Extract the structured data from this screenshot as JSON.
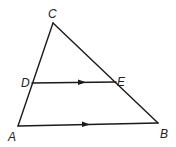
{
  "diagram": {
    "type": "triangle-with-parallel-segment",
    "points": {
      "A": {
        "x": 18,
        "y": 126
      },
      "B": {
        "x": 158,
        "y": 123
      },
      "C": {
        "x": 53,
        "y": 23
      },
      "D": {
        "x": 32,
        "y": 83
      },
      "E": {
        "x": 116,
        "y": 82
      }
    },
    "labels": {
      "A": "A",
      "B": "B",
      "C": "C",
      "D": "D",
      "E": "E"
    },
    "segments": [
      {
        "from": "A",
        "to": "C"
      },
      {
        "from": "C",
        "to": "B"
      },
      {
        "from": "A",
        "to": "B",
        "parallel_mark": true
      },
      {
        "from": "D",
        "to": "E",
        "parallel_mark": true
      }
    ],
    "relations": [
      "DE ∥ AB"
    ]
  }
}
